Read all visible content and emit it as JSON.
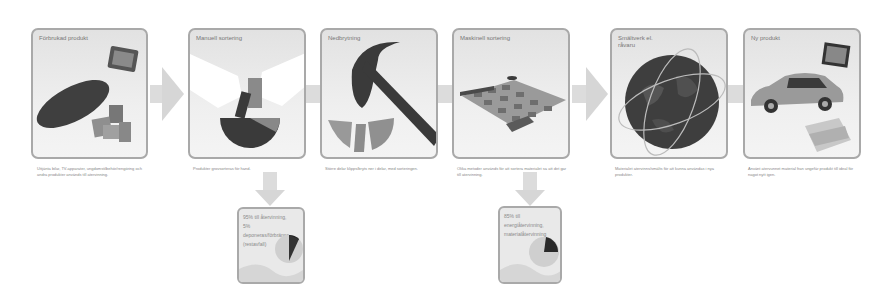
{
  "diagram": {
    "type": "recycling-process-flow",
    "steps": [
      {
        "id": "step-1",
        "title": "Förbrukad produkt",
        "caption": "Uttjänta bilar, TV-apparater, ungdomstilbehör/rengöring och andra produkter används till återvinning."
      },
      {
        "id": "step-2",
        "title": "Manuell sortering",
        "caption": "Produkter grovsorteras för hand."
      },
      {
        "id": "step-3",
        "title": "Nedbrytning",
        "caption": "Större delar klipps/bryts ner i delar, med sorteringen."
      },
      {
        "id": "step-4",
        "title": "Maskinell sortering",
        "caption": "Olika metoder används för att sortera materialet så att det går till återvinning."
      },
      {
        "id": "step-5",
        "title": "Smältverk el.\nråvaru",
        "caption": "Materialet återvinns/smälts för att kunna användas i nya produkter."
      },
      {
        "id": "step-6",
        "title": "Ny produkt",
        "caption": "Använt återvunnet material från ungefär produkt till ideal för något nytt igen."
      }
    ],
    "branches": [
      {
        "id": "branch-1",
        "from": "step-2",
        "text": "95% till återvinning, 5% deponeras/förbränns (restavfall)",
        "pie_highlight": "dark slice"
      },
      {
        "id": "branch-2",
        "from": "step-4",
        "text": "85% till energiåtervinning, materialåtervinning",
        "pie_highlight": "dark slice"
      }
    ],
    "colors": {
      "panel_border": "#a9a9a9",
      "panel_bg": "#e8e8e8",
      "arrow": "#d8d8d8",
      "dark_object": "#3a3a3a"
    }
  }
}
